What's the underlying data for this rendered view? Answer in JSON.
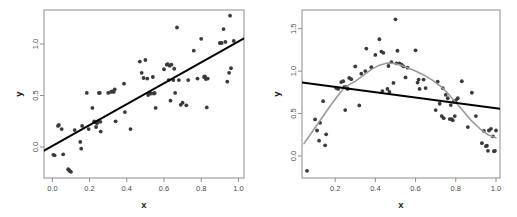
{
  "figure": {
    "title": "",
    "panels": [
      "left",
      "right"
    ]
  },
  "chart_data": [
    {
      "id": "left-panel",
      "type": "scatter",
      "title": "",
      "xlabel": "x",
      "ylabel": "y",
      "xlim": [
        -0.045,
        1.03
      ],
      "ylim": [
        -0.3,
        1.33
      ],
      "xticks": [
        0.0,
        0.2,
        0.4,
        0.6,
        0.8,
        1.0
      ],
      "xticklabels": [
        "0.0",
        "0.2",
        "0.4",
        "0.6",
        "0.8",
        "1.0"
      ],
      "yticks": [
        0.0,
        0.5,
        1.0
      ],
      "yticklabels": [
        "0.0",
        "0.5",
        "1.0"
      ],
      "grid": false,
      "legend": "none",
      "point_color": "#3a3a3a",
      "series": [
        {
          "name": "observations",
          "marker": "filled-circle",
          "x": [
            0.005,
            0.012,
            0.03,
            0.035,
            0.05,
            0.058,
            0.085,
            0.09,
            0.095,
            0.1,
            0.12,
            0.15,
            0.155,
            0.16,
            0.185,
            0.195,
            0.215,
            0.225,
            0.23,
            0.235,
            0.24,
            0.245,
            0.25,
            0.255,
            0.258,
            0.26,
            0.3,
            0.315,
            0.32,
            0.33,
            0.335,
            0.34,
            0.385,
            0.39,
            0.42,
            0.47,
            0.48,
            0.49,
            0.5,
            0.51,
            0.515,
            0.52,
            0.53,
            0.54,
            0.545,
            0.55,
            0.555,
            0.6,
            0.615,
            0.62,
            0.625,
            0.63,
            0.635,
            0.64,
            0.65,
            0.655,
            0.66,
            0.67,
            0.68,
            0.69,
            0.7,
            0.72,
            0.73,
            0.76,
            0.78,
            0.8,
            0.815,
            0.82,
            0.825,
            0.83,
            0.835,
            0.9,
            0.91,
            0.92,
            0.93,
            0.94,
            0.95,
            0.955,
            0.96,
            0.975
          ],
          "y": [
            -0.075,
            -0.08,
            0.205,
            0.215,
            0.175,
            -0.07,
            -0.215,
            -0.225,
            -0.235,
            -0.24,
            0.165,
            0.05,
            -0.015,
            0.205,
            0.525,
            0.175,
            0.38,
            0.25,
            0.24,
            0.195,
            0.23,
            0.25,
            0.525,
            0.525,
            0.245,
            0.15,
            0.525,
            0.535,
            0.54,
            0.535,
            0.56,
            0.25,
            0.615,
            0.34,
            0.175,
            0.83,
            0.72,
            0.67,
            0.845,
            0.665,
            0.505,
            0.52,
            0.52,
            0.68,
            0.52,
            0.525,
            0.38,
            0.755,
            0.8,
            0.805,
            0.65,
            0.79,
            0.45,
            0.8,
            0.65,
            0.76,
            0.525,
            1.16,
            0.65,
            0.41,
            0.43,
            0.405,
            0.65,
            0.935,
            0.665,
            1.05,
            0.68,
            0.685,
            0.66,
            0.385,
            0.665,
            1.01,
            1.01,
            1.145,
            1.02,
            0.635,
            0.72,
            1.275,
            0.765,
            1.03
          ]
        }
      ],
      "fit_line": {
        "name": "linear-fit",
        "color": "#000000",
        "x": [
          -0.045,
          1.03
        ],
        "y": [
          -0.035,
          1.055
        ]
      }
    },
    {
      "id": "right-panel",
      "type": "scatter",
      "title": "",
      "xlabel": "x",
      "ylabel": "y",
      "xlim": [
        0.035,
        1.02
      ],
      "ylim": [
        -0.26,
        1.72
      ],
      "xticks": [
        0.2,
        0.4,
        0.6,
        0.8,
        1.0
      ],
      "xticklabels": [
        "0.2",
        "0.4",
        "0.6",
        "0.8",
        "1.0"
      ],
      "yticks": [
        0.0,
        0.5,
        1.0,
        1.5
      ],
      "yticklabels": [
        "0.0",
        "0.5",
        "1.0",
        "1.5"
      ],
      "grid": false,
      "legend": "none",
      "point_color": "#3a3a3a",
      "series": [
        {
          "name": "observations",
          "marker": "filled-circle",
          "x": [
            0.06,
            0.1,
            0.11,
            0.12,
            0.125,
            0.14,
            0.15,
            0.155,
            0.205,
            0.215,
            0.23,
            0.24,
            0.245,
            0.25,
            0.255,
            0.258,
            0.262,
            0.27,
            0.28,
            0.3,
            0.32,
            0.33,
            0.35,
            0.355,
            0.38,
            0.4,
            0.42,
            0.43,
            0.435,
            0.44,
            0.46,
            0.465,
            0.47,
            0.48,
            0.49,
            0.5,
            0.505,
            0.51,
            0.52,
            0.53,
            0.54,
            0.55,
            0.56,
            0.6,
            0.61,
            0.615,
            0.62,
            0.64,
            0.65,
            0.7,
            0.71,
            0.72,
            0.73,
            0.735,
            0.74,
            0.75,
            0.76,
            0.77,
            0.775,
            0.78,
            0.785,
            0.79,
            0.795,
            0.8,
            0.81,
            0.83,
            0.86,
            0.88,
            0.9,
            0.93,
            0.94,
            0.95,
            0.955,
            0.96,
            0.965,
            0.975,
            0.985,
            0.99,
            0.995,
            1.0
          ],
          "y": [
            -0.175,
            0.43,
            0.3,
            0.18,
            0.39,
            0.645,
            0.125,
            0.255,
            0.8,
            0.79,
            0.87,
            0.88,
            0.81,
            0.54,
            0.815,
            0.8,
            0.79,
            0.92,
            0.905,
            1.055,
            0.595,
            0.97,
            1.0,
            1.265,
            1.045,
            1.19,
            1.375,
            1.23,
            0.765,
            1.215,
            0.79,
            1.06,
            0.755,
            1.105,
            0.86,
            1.61,
            1.09,
            1.24,
            1.09,
            1.075,
            1.055,
            0.925,
            1.04,
            1.245,
            0.865,
            0.9,
            0.79,
            0.9,
            0.8,
            0.54,
            0.875,
            0.615,
            0.47,
            0.8,
            0.445,
            0.72,
            0.68,
            0.435,
            0.6,
            0.435,
            0.42,
            0.64,
            0.47,
            0.655,
            0.68,
            0.88,
            0.34,
            0.745,
            0.47,
            0.15,
            0.295,
            0.115,
            0.12,
            0.06,
            0.3,
            0.32,
            0.23,
            0.055,
            0.06,
            0.3
          ]
        }
      ],
      "fit_line": {
        "name": "linear-fit",
        "color": "#000000",
        "x": [
          0.035,
          1.02
        ],
        "y": [
          0.865,
          0.555
        ]
      },
      "smooth_line": {
        "name": "loess-smooth",
        "color": "#9a9a9a",
        "x": [
          0.045,
          0.09,
          0.13,
          0.17,
          0.21,
          0.24,
          0.27,
          0.3,
          0.34,
          0.38,
          0.42,
          0.46,
          0.49,
          0.52,
          0.56,
          0.6,
          0.64,
          0.68,
          0.72,
          0.76,
          0.8,
          0.84,
          0.88,
          0.92,
          0.96,
          1.0
        ],
        "y": [
          0.145,
          0.3,
          0.435,
          0.57,
          0.7,
          0.79,
          0.84,
          0.88,
          0.95,
          1.02,
          1.07,
          1.095,
          1.09,
          1.075,
          1.04,
          1.0,
          0.955,
          0.9,
          0.83,
          0.74,
          0.63,
          0.52,
          0.41,
          0.32,
          0.25,
          0.215
        ]
      }
    }
  ]
}
